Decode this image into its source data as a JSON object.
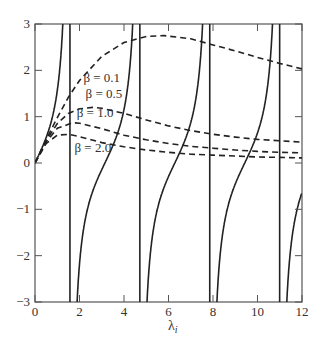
{
  "chart_data": {
    "type": "line",
    "title": "",
    "xlabel": "λ",
    "xlabel_subscript": "i",
    "ylabel": "",
    "xlim": [
      0,
      12
    ],
    "ylim": [
      -3,
      3
    ],
    "xticks": [
      0,
      2,
      4,
      6,
      8,
      10,
      12
    ],
    "yticks": [
      -3,
      -2,
      -1,
      0,
      1,
      2,
      3
    ],
    "grid": false,
    "legend": "inline annotations",
    "asymptotes": [
      1.5708,
      4.7124,
      7.854,
      10.9956
    ],
    "solid_curve": {
      "name": "tan(λ)",
      "style": "solid"
    },
    "series": [
      {
        "name": "β = 0.1",
        "style": "dashed",
        "x": [
          0,
          0.5,
          1,
          1.5,
          2,
          3,
          4,
          5,
          5.8,
          7,
          8,
          9,
          10,
          11,
          12
        ],
        "y": [
          0,
          0.5,
          0.98,
          1.42,
          1.78,
          2.3,
          2.6,
          2.73,
          2.75,
          2.68,
          2.55,
          2.42,
          2.28,
          2.15,
          2.03
        ]
      },
      {
        "name": "β = 0.5",
        "style": "dashed",
        "x": [
          0,
          0.5,
          1,
          1.5,
          2,
          2.6,
          3,
          4,
          5,
          6,
          7,
          8,
          9,
          10,
          11,
          12
        ],
        "y": [
          0,
          0.48,
          0.85,
          1.07,
          1.17,
          1.2,
          1.18,
          1.07,
          0.93,
          0.8,
          0.7,
          0.62,
          0.56,
          0.51,
          0.48,
          0.45
        ]
      },
      {
        "name": "β = 1.0",
        "style": "dashed",
        "x": [
          0,
          0.5,
          1,
          1.7,
          2,
          3,
          4,
          5,
          6,
          7,
          8,
          9,
          10,
          11,
          12
        ],
        "y": [
          0,
          0.45,
          0.75,
          0.87,
          0.86,
          0.74,
          0.6,
          0.5,
          0.42,
          0.36,
          0.32,
          0.28,
          0.25,
          0.23,
          0.22
        ]
      },
      {
        "name": "β = 2.0",
        "style": "dashed",
        "x": [
          0,
          0.5,
          1,
          1.5,
          2,
          3,
          4,
          5,
          6,
          7,
          8,
          9,
          10,
          11,
          12
        ],
        "y": [
          0,
          0.42,
          0.6,
          0.62,
          0.57,
          0.44,
          0.35,
          0.28,
          0.23,
          0.19,
          0.17,
          0.15,
          0.13,
          0.12,
          0.11
        ]
      }
    ],
    "annotations": [
      {
        "text": "β = 0.1",
        "x": 3.0,
        "y": 1.75
      },
      {
        "text": "β = 0.5",
        "x": 3.1,
        "y": 1.4
      },
      {
        "text": "β = 1.0",
        "x": 2.7,
        "y": 1.0
      },
      {
        "text": "β = 2.0",
        "x": 2.6,
        "y": 0.24
      }
    ]
  }
}
